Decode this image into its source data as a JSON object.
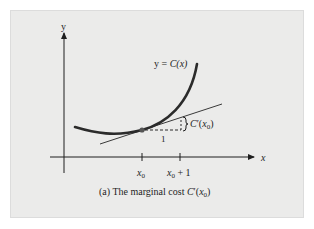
{
  "figure": {
    "axis_labels": {
      "x": "x",
      "y": "y"
    },
    "curve_label": {
      "prefix": "y = ",
      "func": "C",
      "arg": "(x)"
    },
    "tick_labels": [
      {
        "base": "x",
        "sub": "0",
        "suffix": ""
      },
      {
        "base": "x",
        "sub": "0",
        "suffix": " + 1"
      }
    ],
    "run_label": "1",
    "rise_label": {
      "func": "C",
      "prime": "′",
      "open": "(",
      "base": "x",
      "sub": "0",
      "close": ")"
    },
    "caption": {
      "prefix": "(a) The marginal cost ",
      "func": "C",
      "prime": "′",
      "open": "(",
      "base": "x",
      "sub": "0",
      "close": ")"
    },
    "colors": {
      "background": "#ebebea",
      "curve": "#2b2b2b",
      "tangent": "#3a3a3a",
      "axes": "#1e1e1e",
      "point": "#555555"
    }
  }
}
